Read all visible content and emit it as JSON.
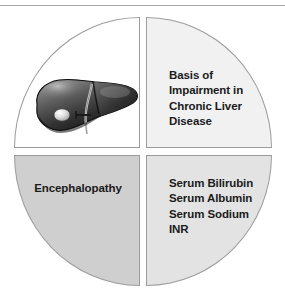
{
  "figure": {
    "type": "four-quadrant-circle-diagram",
    "shape": "circle divided into four quadrants",
    "quadrants": [
      {
        "position": "top-left",
        "content_type": "image",
        "image_name": "liver-illustration",
        "image_description": "grayscale anatomical illustration of a human liver with gallbladder and bile duct",
        "fill_color": "#ffffff",
        "text": ""
      },
      {
        "position": "top-right",
        "content_type": "text",
        "fill_color": "#f1f1f1",
        "text": "Basis of\nImpairment in\nChronic Liver\nDisease",
        "lines": [
          "Basis of",
          "Impairment in",
          "Chronic Liver",
          "Disease"
        ]
      },
      {
        "position": "bottom-left",
        "content_type": "text",
        "fill_color": "#cfcfcf",
        "text": "Encephalopathy",
        "lines": [
          "Encephalopathy"
        ]
      },
      {
        "position": "bottom-right",
        "content_type": "text",
        "fill_color": "#e3e3e3",
        "text": "Serum Bilirubin\nSerum Albumin\nSerum Sodium\nINR",
        "lines": [
          "Serum Bilirubin",
          "Serum Albumin",
          "Serum Sodium",
          "INR"
        ]
      }
    ],
    "colors": {
      "outline": "#9b9b9b",
      "text": "#1b1b1b",
      "top_rule": "#a8a8a8",
      "background": "#ffffff"
    }
  }
}
